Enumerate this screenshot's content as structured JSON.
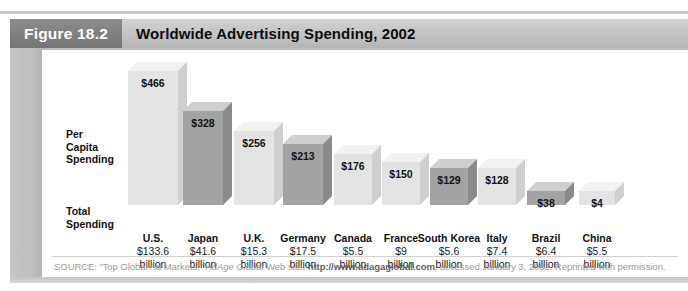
{
  "figure": {
    "tag": "Figure 18.2",
    "title": "Worldwide Advertising Spending, 2002"
  },
  "labels": {
    "per_capita": "Per\nCapita\nSpending",
    "per_capita_lines": [
      "Per",
      "Capita",
      "Spending"
    ],
    "total_spending": "Total\nSpending",
    "total_spending_lines": [
      "Total",
      "Spending"
    ],
    "unit_word": "billion"
  },
  "source": {
    "prefix": "SOURCE: “Top Global Ad Markets,” ",
    "italic": "AdAge Global",
    "middle": " Web site, ",
    "url": "http://www.adagaglobal.com",
    "suffix": ", accessed January 3, 2003. Reprinted with permission."
  },
  "colors": {
    "tag_bg": "#7e7e7e",
    "header_bg": "#c2c2c2",
    "panel_border": "#bdbdbd",
    "bar_light_front": "#e3e3e3",
    "bar_light_top": "#f2f2f2",
    "bar_light_side": "#cfcfcf",
    "bar_dark_front": "#a3a3a3",
    "bar_dark_top": "#cfcfcf",
    "bar_dark_side": "#8a8a8a",
    "text": "#111111",
    "source_text": "#9a9a9a"
  },
  "chart_data": {
    "type": "bar",
    "title": "Worldwide Advertising Spending, 2002",
    "xlabel": "",
    "ylabel": "Per Capita Spending",
    "ylim": [
      0,
      500
    ],
    "grid": false,
    "legend": "none",
    "value_prefix": "$",
    "categories": [
      "U.S.",
      "Japan",
      "U.K.",
      "Germany",
      "Canada",
      "France",
      "South Korea",
      "Italy",
      "Brazil",
      "China"
    ],
    "values": [
      466,
      328,
      256,
      213,
      176,
      150,
      129,
      128,
      38,
      4
    ],
    "value_labels": [
      "$466",
      "$328",
      "$256",
      "$213",
      "$176",
      "$150",
      "$129",
      "$128",
      "$38",
      "$4"
    ],
    "series": [
      {
        "name": "Per Capita Spending",
        "values": [
          466,
          328,
          256,
          213,
          176,
          150,
          129,
          128,
          38,
          4
        ]
      },
      {
        "name": "Total Spending (US$ billion)",
        "values": [
          133.6,
          41.6,
          15.3,
          17.5,
          5.5,
          9,
          5.6,
          7.4,
          6.4,
          5.5
        ]
      }
    ],
    "total_spending_labels": [
      "$133.6",
      "$41.6",
      "$15.3",
      "$17.5",
      "$5.5",
      "$9",
      "$5.6",
      "$7.4",
      "$6.4",
      "$5.5"
    ],
    "bar_shades": [
      "light",
      "dark",
      "light",
      "dark",
      "light",
      "light",
      "dark",
      "light",
      "dark",
      "light"
    ]
  }
}
